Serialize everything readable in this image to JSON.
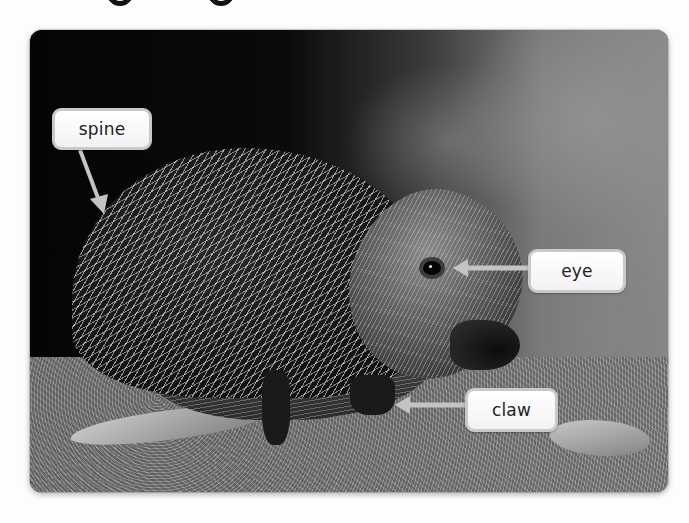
{
  "diagram": {
    "image_style": "black-and-white photograph",
    "labels": [
      {
        "id": "spine",
        "text": "spine",
        "box": {
          "x": 52,
          "y": 108,
          "w": 100,
          "h": 42
        },
        "arrow": {
          "from": [
            80,
            150
          ],
          "to": [
            102,
            212
          ]
        }
      },
      {
        "id": "eye",
        "text": "eye",
        "box": {
          "x": 528,
          "y": 249,
          "w": 98,
          "h": 44
        },
        "arrow": {
          "from": [
            528,
            268
          ],
          "to": [
            455,
            268
          ]
        }
      },
      {
        "id": "claw",
        "text": "claw",
        "box": {
          "x": 465,
          "y": 388,
          "w": 93,
          "h": 44
        },
        "arrow": {
          "from": [
            465,
            405
          ],
          "to": [
            397,
            405
          ]
        }
      }
    ]
  },
  "colors": {
    "page_background": "#fdfdfd",
    "label_border": "#c9c9c9",
    "label_fill": "#f7f7f7",
    "arrow": "#c4c4c4",
    "label_text": "#222222"
  }
}
